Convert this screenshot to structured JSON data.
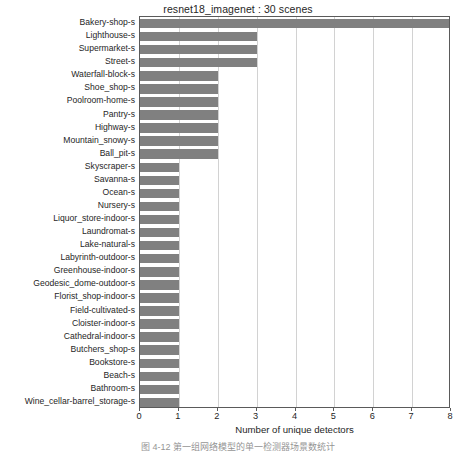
{
  "chart_data": {
    "type": "bar",
    "orientation": "horizontal",
    "title": "resnet18_imagenet : 30 scenes",
    "xlabel": "Number of unique detectors",
    "ylabel": "",
    "xlim": [
      0,
      8
    ],
    "ylim": [
      0,
      30
    ],
    "grid": "vertical",
    "legend": null,
    "bar_color": "#808080",
    "xticks": [
      "0",
      "1",
      "2",
      "3",
      "4",
      "5",
      "6",
      "7",
      "8"
    ],
    "xtick_values": [
      0,
      1,
      2,
      3,
      4,
      5,
      6,
      7,
      8
    ],
    "categories": [
      "Bakery-shop-s",
      "Lighthouse-s",
      "Supermarket-s",
      "Street-s",
      "Waterfall-block-s",
      "Shoe_shop-s",
      "Poolroom-home-s",
      "Pantry-s",
      "Highway-s",
      "Mountain_snowy-s",
      "Ball_pit-s",
      "Skyscraper-s",
      "Savanna-s",
      "Ocean-s",
      "Nursery-s",
      "Liquor_store-indoor-s",
      "Laundromat-s",
      "Lake-natural-s",
      "Labyrinth-outdoor-s",
      "Greenhouse-indoor-s",
      "Geodesic_dome-outdoor-s",
      "Florist_shop-indoor-s",
      "Field-cultivated-s",
      "Cloister-indoor-s",
      "Cathedral-indoor-s",
      "Butchers_shop-s",
      "Bookstore-s",
      "Beach-s",
      "Bathroom-s",
      "Wine_cellar-barrel_storage-s"
    ],
    "values": [
      8,
      3,
      3,
      3,
      2,
      2,
      2,
      2,
      2,
      2,
      2,
      1,
      1,
      1,
      1,
      1,
      1,
      1,
      1,
      1,
      1,
      1,
      1,
      1,
      1,
      1,
      1,
      1,
      1,
      1
    ]
  },
  "caption": {
    "text": "图 4-12 第一组网络模型的单一检测器场景数统计"
  }
}
